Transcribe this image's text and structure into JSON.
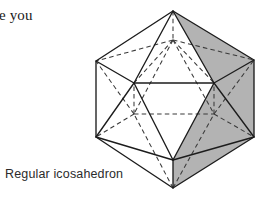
{
  "page": {
    "background_color": "#ffffff",
    "width": 261,
    "height": 206
  },
  "body_text": {
    "fragment": "re you"
  },
  "figure": {
    "caption": "Regular icosahedron",
    "name": "regular-icosahedron",
    "colors": {
      "shaded_face": "#b3b3b3",
      "blank_face": "#ffffff",
      "visible_edge": "#1c1c1c",
      "hidden_edge": "#3a3a3a"
    },
    "vertices": {
      "top_apex": [
        173,
        11
      ],
      "bottom_apex": [
        173,
        188
      ],
      "upper_back": [
        173,
        40
      ],
      "upper_left_out": [
        96,
        61
      ],
      "upper_right_out": [
        254,
        60
      ],
      "upper_front_left": [
        134,
        83
      ],
      "upper_front_right": [
        214,
        83
      ],
      "lower_back_left": [
        134,
        114
      ],
      "lower_back_right": [
        214,
        114
      ],
      "lower_left_out": [
        96,
        137
      ],
      "lower_right_out": [
        254,
        137
      ],
      "lower_front": [
        173,
        160
      ]
    },
    "shaded_faces": [
      "top-apex-right-upper",
      "upper-right-band",
      "lower-right-band",
      "bottom-apex-right-lower"
    ]
  }
}
